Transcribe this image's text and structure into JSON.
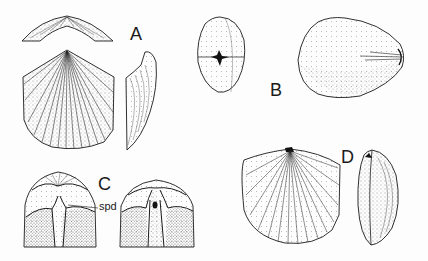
{
  "figure": {
    "panels": [
      {
        "id": "A",
        "label": "A",
        "views": [
          "hinge-view",
          "dorsal-valve",
          "lateral-profile"
        ]
      },
      {
        "id": "B",
        "label": "B",
        "views": [
          "posterior-end-view",
          "dorsal-valve-smooth"
        ]
      },
      {
        "id": "C",
        "label": "C",
        "views": [
          "interior-left",
          "interior-right"
        ],
        "annotations": [
          {
            "text": "spd"
          }
        ]
      },
      {
        "id": "D",
        "label": "D",
        "views": [
          "dorsal-valve",
          "lateral-profile"
        ]
      }
    ],
    "colors": {
      "ink": "#1a1a1a",
      "background": "#fdfdfd"
    }
  }
}
